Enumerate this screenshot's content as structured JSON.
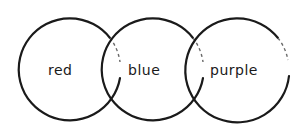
{
  "diagram": {
    "type": "venn-chain",
    "style": "hand-drawn",
    "circles": [
      {
        "label": "red",
        "cx": 70,
        "cy": 70,
        "r": 51
      },
      {
        "label": "blue",
        "cx": 153,
        "cy": 70,
        "r": 51
      },
      {
        "label": "purple",
        "cx": 237,
        "cy": 69,
        "r": 52
      }
    ],
    "stroke_color": "#1a1a1a",
    "background": "#ffffff"
  }
}
